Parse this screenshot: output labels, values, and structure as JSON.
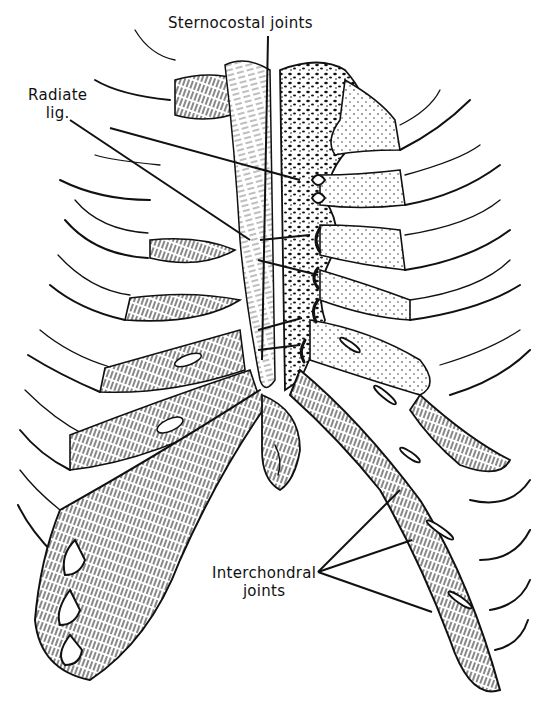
{
  "figure": {
    "style": "black-and-white anatomical line drawing",
    "colors": {
      "ink": "#111111",
      "background": "#ffffff"
    }
  },
  "labels": {
    "sternocostal": "Sternocostal joints",
    "radiate_line1": "Radiate",
    "radiate_line2": "lig.",
    "interchondral_line1": "Interchondral",
    "interchondral_line2": "joints"
  }
}
